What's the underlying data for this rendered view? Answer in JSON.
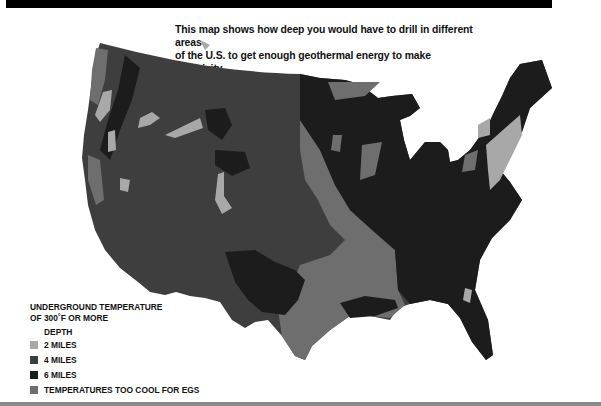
{
  "caption": {
    "line1": "This map shows how deep you would have to drill in different areas",
    "line2": "of the U.S. to get enough geothermal energy to make electricity."
  },
  "legend": {
    "title_line1": "UNDERGROUND TEMPERATURE",
    "title_line2": "OF 300˚F OR MORE",
    "depth_label": "DEPTH",
    "items": [
      {
        "label": "2 MILES",
        "color": "#a8a8a8"
      },
      {
        "label": "4 MILES",
        "color": "#3e3e3e"
      },
      {
        "label": "6 MILES",
        "color": "#1c1c1c"
      },
      {
        "label": "TEMPERATURES TOO COOL FOR EGS",
        "color": "#6e6e6e"
      }
    ]
  },
  "map": {
    "region": "Contiguous United States",
    "colors": {
      "two_miles": "#a8a8a8",
      "four_miles": "#3e3e3e",
      "six_miles": "#1c1c1c",
      "too_cool": "#6e6e6e"
    }
  }
}
